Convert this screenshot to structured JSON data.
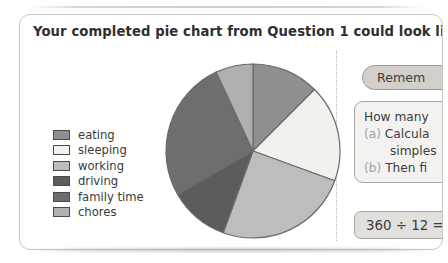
{
  "headline": "Your completed pie chart from Question 1 could look like this!",
  "legend": {
    "items": [
      {
        "label": "eating",
        "color": "#8f8f8f"
      },
      {
        "label": "sleeping",
        "color": "#f2f1ee"
      },
      {
        "label": "working",
        "color": "#bdbdbd"
      },
      {
        "label": "driving",
        "color": "#5c5c5c"
      },
      {
        "label": "family time",
        "color": "#6e6e6e"
      },
      {
        "label": "chores",
        "color": "#b0b0b0"
      }
    ]
  },
  "right_panel": {
    "remember_label": "Remem",
    "question_lines": [
      {
        "marker": "",
        "text": "How many",
        "indent": false
      },
      {
        "marker": "(a)",
        "text": "Calcula",
        "indent": false
      },
      {
        "marker": "",
        "text": "simples",
        "indent": true
      },
      {
        "marker": "(b)",
        "text": "Then fi",
        "indent": false
      }
    ],
    "sum_text": "360 ÷ 12 ="
  },
  "chart_data": {
    "type": "pie",
    "title": "Your completed pie chart from Question 1 could look like this!",
    "categories": [
      "eating",
      "sleeping",
      "working",
      "driving",
      "family time",
      "chores"
    ],
    "values": [
      45,
      65,
      90,
      40,
      95,
      25
    ],
    "unit": "degrees",
    "start_angle": 0,
    "direction": "clockwise",
    "colors": [
      "#8f8f8f",
      "#f2f1ee",
      "#bdbdbd",
      "#5c5c5c",
      "#6e6e6e",
      "#b0b0b0"
    ],
    "legend_position": "left",
    "grid": false,
    "stroke": "#6b6b6b"
  }
}
